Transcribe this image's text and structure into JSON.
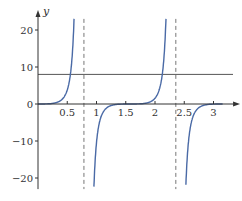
{
  "chart_data": {
    "type": "line",
    "title": "",
    "xlabel": "t",
    "ylabel": "y",
    "xlim": [
      0,
      3.3
    ],
    "ylim": [
      -23,
      23
    ],
    "grid": false,
    "x_ticks": [
      0.5,
      1,
      1.5,
      2,
      2.5,
      3
    ],
    "x_tick_labels": [
      "0.5",
      "1",
      "1.5",
      "2",
      "2.5",
      "3"
    ],
    "y_ticks": [
      -20,
      -10,
      0,
      10,
      20
    ],
    "y_tick_labels": [
      "−20",
      "−10",
      "0",
      "10",
      "20"
    ],
    "series": [
      {
        "name": "curve",
        "color": "#4a6aa6",
        "description": "periodic tan-like curve with vertical asymptotes",
        "x": [
          0,
          0.2,
          0.4,
          0.5,
          0.6,
          0.7,
          0.75,
          0.78,
          0.8,
          0.85,
          0.9,
          1.0,
          1.2,
          1.4,
          1.571,
          1.7,
          1.9,
          2.0,
          2.2,
          2.3,
          2.35,
          2.37,
          2.4,
          2.5,
          2.6,
          2.8,
          3.0,
          3.14
        ],
        "y": [
          0,
          0.07,
          0.9,
          3.8,
          4.9,
          14,
          23,
          23,
          -23,
          -23,
          -12,
          -4.9,
          -0.9,
          -0.04,
          0,
          0.02,
          0.9,
          3.8,
          14,
          23,
          23,
          -23,
          -23,
          -4.9,
          -1.5,
          -0.2,
          -0.01,
          0
        ]
      },
      {
        "name": "horizontal line",
        "color": "#555555",
        "x": [
          0,
          3.3
        ],
        "y": [
          8,
          8
        ]
      }
    ],
    "asymptotes": [
      {
        "x": 0.785,
        "style": "dashed"
      },
      {
        "x": 2.356,
        "style": "dashed"
      }
    ]
  }
}
